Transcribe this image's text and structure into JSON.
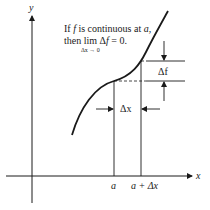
{
  "diagram": {
    "caption_line1": "If f is continuous at a,",
    "caption_line1_parts": [
      "If ",
      "f",
      " is continuous at ",
      "a",
      ","
    ],
    "caption_line2_parts": [
      "then lim ",
      "Δ",
      "f",
      " = 0."
    ],
    "caption_limit_subscript": "Δx → 0",
    "axis_x_label": "x",
    "axis_y_label": "y",
    "tick_a_label": "a",
    "tick_a_plus_dx_label": "a + Δx",
    "delta_x_label": "Δx",
    "delta_f_label": "Δf",
    "colors": {
      "ink": "#1a1a1a",
      "background": "#ffffff"
    }
  }
}
